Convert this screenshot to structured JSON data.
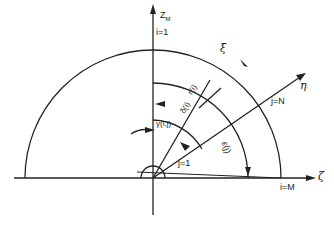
{
  "diagram": {
    "type": "polar coordinate grid diagram",
    "axes": {
      "vertical": "Z_M",
      "horizontal": "ζ",
      "radial": "η"
    },
    "labels": {
      "z_axis": "Z",
      "z_axis_sub": "M",
      "i_top": "i=1",
      "xi": "ξ",
      "eta": "η",
      "zeta": "ζ",
      "j_N": "j=N",
      "j_1": "j=1",
      "i_M": "i=M",
      "r_ij": "r(i)",
      "delta_i": "δ(i)",
      "gamma_ij": "γ̅(i,j)",
      "eps_j": "ε(j)"
    },
    "colors": {
      "line": "#222222",
      "background": "#ffffff"
    }
  }
}
